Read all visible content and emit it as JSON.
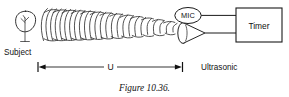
{
  "figure": {
    "caption": "Figure 10.36.",
    "background_color": "#ffffff",
    "ink_color": "#111111"
  },
  "labels": {
    "subject": "Subject",
    "mic": "MIC",
    "timer": "Timer",
    "ultrasonic": "Ultrasonic",
    "distance_symbol": "U"
  },
  "diagram": {
    "type": "ultrasonic-distance-measurement-schematic",
    "elements": [
      "subject-head-outline",
      "ultrasonic-wavefronts",
      "ultrasonic-transducer-horn",
      "microphone",
      "timer-box",
      "distance-dimension-line"
    ],
    "wavefront_count": 18,
    "dimension": {
      "symbol": "U",
      "from": "subject",
      "to": "ultrasonic-transducer"
    }
  }
}
